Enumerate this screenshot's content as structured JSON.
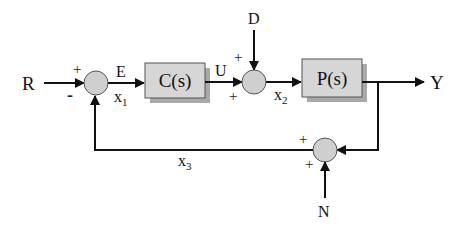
{
  "diagram": {
    "blocks": [
      {
        "id": "controller",
        "label": "C(s)"
      },
      {
        "id": "plant",
        "label": "P(s)"
      }
    ],
    "signals": {
      "reference": "R",
      "error": "E",
      "control": "U",
      "disturbance": "D",
      "output": "Y",
      "noise": "N"
    },
    "states": {
      "x1": {
        "base": "x",
        "sub": "1"
      },
      "x2": {
        "base": "x",
        "sub": "2"
      },
      "x3": {
        "base": "x",
        "sub": "3"
      }
    },
    "junctions": {
      "sum1": {
        "top_sign": "+",
        "bottom_sign": "-"
      },
      "sum2": {
        "top_sign": "+",
        "bottom_sign": "+"
      },
      "sum3": {
        "top_sign": "+",
        "bottom_sign": "+"
      }
    },
    "colors": {
      "block_fill": "#d6d6d6",
      "block_shadow": "#a9a9a9",
      "junction_fill": "#cfcfcf",
      "wire": "#111111"
    }
  }
}
